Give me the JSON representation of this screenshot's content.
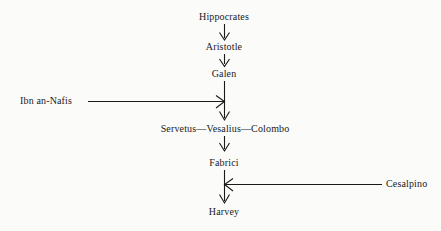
{
  "diagram": {
    "background_color": "#fbfbfa",
    "line_color": "#1a1a1a",
    "text_color": "#1a1a1a",
    "chain": [
      {
        "id": "hippocrates",
        "label": "Hippocrates",
        "cx": 224,
        "top": 11
      },
      {
        "id": "aristotle",
        "label": "Aristotle",
        "cx": 224,
        "top": 41
      },
      {
        "id": "galen",
        "label": "Galen",
        "cx": 224,
        "top": 68
      },
      {
        "id": "servetus-vesalius-colombo",
        "label": "Servetus—Vesalius—Colombo",
        "cx": 225,
        "top": 123
      },
      {
        "id": "fabrici",
        "label": "Fabrici",
        "cx": 224,
        "top": 157
      },
      {
        "id": "harvey",
        "label": "Harvey",
        "cx": 224,
        "top": 206
      }
    ],
    "side_nodes": [
      {
        "id": "ibn-an-nafis",
        "label": "Ibn an-Nafis",
        "left": 20,
        "top": 95,
        "direction": "right"
      },
      {
        "id": "cesalpino",
        "label": "Cesalpino",
        "left": 386,
        "top": 178,
        "direction": "left"
      }
    ],
    "connectors": [
      {
        "id": "hippocrates-to-aristotle",
        "from": "hippocrates",
        "to": "aristotle",
        "orientation": "vertical",
        "arrow": "down"
      },
      {
        "id": "aristotle-to-galen",
        "from": "aristotle",
        "to": "galen",
        "orientation": "vertical",
        "arrow": "down"
      },
      {
        "id": "galen-to-servetus",
        "from": "galen",
        "to": "servetus-vesalius-colombo",
        "orientation": "vertical",
        "arrow": "down"
      },
      {
        "id": "servetus-to-fabrici",
        "from": "servetus-vesalius-colombo",
        "to": "fabrici",
        "orientation": "vertical",
        "arrow": "down"
      },
      {
        "id": "fabrici-to-harvey",
        "from": "fabrici",
        "to": "harvey",
        "orientation": "vertical",
        "arrow": "down"
      },
      {
        "id": "ibn-an-nafis-to-chain",
        "from": "ibn-an-nafis",
        "to": "galen-to-servetus",
        "orientation": "horizontal",
        "arrow": "right"
      },
      {
        "id": "cesalpino-to-chain",
        "from": "cesalpino",
        "to": "fabrici-to-harvey",
        "orientation": "horizontal",
        "arrow": "left"
      }
    ]
  }
}
